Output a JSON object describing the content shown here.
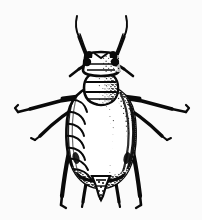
{
  "figure": {
    "kind": "scientific-line-drawing",
    "view": "dorsal",
    "title": "",
    "caption": "",
    "background_color": "#fbfbfb",
    "ink_color": "#0a0a0a",
    "fill_color": "#ffffff",
    "width": 202,
    "height": 220
  },
  "anatomy": {
    "antennae": [
      {
        "name": "left-antenna",
        "side": "left",
        "tip_x": 76,
        "tip_y": 15,
        "base_x": 88,
        "base_y": 62
      },
      {
        "name": "right-antenna",
        "side": "right",
        "tip_x": 127,
        "tip_y": 15,
        "base_x": 114,
        "base_y": 62
      }
    ],
    "head": {
      "name": "head",
      "center_x": 101,
      "center_y": 66,
      "width": 36,
      "height": 20,
      "eyes": [
        {
          "name": "left-compound-eye",
          "cx": 87,
          "cy": 63,
          "r": 4
        },
        {
          "name": "right-compound-eye",
          "cx": 115,
          "cy": 63,
          "r": 4
        }
      ]
    },
    "thorax": {
      "name": "thorax",
      "center_x": 101,
      "center_y": 88,
      "width": 30,
      "height": 28
    },
    "abdomen": {
      "name": "abdomen",
      "center_x": 101,
      "center_y": 133,
      "width": 64,
      "height": 96,
      "segment_count": 7,
      "shaded_side": "right"
    },
    "cauda": {
      "name": "cauda",
      "tip_x": 101,
      "tip_y": 196,
      "base_y": 176
    },
    "legs": [
      {
        "name": "left-foreleg",
        "side": "left",
        "tip_x": 15,
        "tip_y": 113
      },
      {
        "name": "left-midleg",
        "side": "left",
        "tip_x": 36,
        "tip_y": 139
      },
      {
        "name": "left-hindleg",
        "side": "left",
        "tip_x": 62,
        "tip_y": 208
      },
      {
        "name": "right-foreleg",
        "side": "right",
        "tip_x": 189,
        "tip_y": 113
      },
      {
        "name": "right-midleg",
        "side": "right",
        "tip_x": 168,
        "tip_y": 139
      },
      {
        "name": "right-hindleg",
        "side": "right",
        "tip_x": 141,
        "tip_y": 208
      }
    ],
    "inner_hind_legs": [
      {
        "name": "left-inner-hindleg",
        "side": "left",
        "tip_x": 83,
        "tip_y": 208
      },
      {
        "name": "right-inner-hindleg",
        "side": "right",
        "tip_x": 120,
        "tip_y": 208
      }
    ]
  },
  "labels": {
    "figure_label": "",
    "scale_bar": ""
  }
}
